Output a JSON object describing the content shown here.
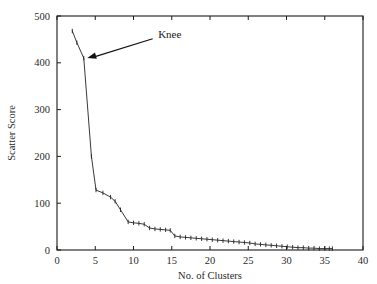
{
  "chart_data": {
    "type": "line",
    "title": "",
    "xlabel": "No. of Clusters",
    "ylabel": "Scatter Score",
    "xlim": [
      0,
      40
    ],
    "ylim": [
      0,
      500
    ],
    "grid": false,
    "legend": null,
    "xticks": [
      0,
      5,
      10,
      15,
      20,
      25,
      30,
      35,
      40
    ],
    "xtick_labels": [
      "0",
      "5",
      "10",
      "15",
      "20",
      "25",
      "30",
      "35",
      "40"
    ],
    "yticks": [
      0,
      100,
      200,
      300,
      400,
      500
    ],
    "ytick_labels": [
      "0",
      "100",
      "200",
      "300",
      "400",
      "500"
    ],
    "marker": "plus-tick",
    "line_color": "#232323",
    "series": [
      {
        "name": "Scatter Score",
        "x": [
          2.0,
          2.6,
          3.5,
          4.5,
          5.1,
          6.0,
          7.0,
          7.6,
          8.3,
          9.3,
          10.0,
          10.7,
          11.4,
          12.1,
          12.8,
          13.5,
          14.2,
          14.8,
          15.4,
          16.1,
          16.8,
          17.5,
          18.2,
          18.9,
          19.6,
          20.3,
          21.0,
          21.7,
          22.4,
          23.1,
          23.8,
          24.5,
          25.2,
          25.9,
          26.6,
          27.3,
          28.0,
          28.7,
          29.4,
          30.1,
          30.8,
          31.5,
          32.2,
          32.9,
          33.6,
          34.3,
          35.0,
          35.6,
          36.0
        ],
        "y": [
          468,
          443,
          410,
          200,
          128,
          122,
          113,
          104,
          86,
          60,
          58,
          57,
          55,
          47,
          45,
          44,
          43,
          42,
          30,
          28,
          27,
          26,
          25,
          24,
          23,
          22,
          21,
          20,
          19,
          18,
          17,
          16,
          15,
          13,
          12,
          11,
          10,
          9,
          8,
          7,
          6,
          5,
          5,
          4,
          4,
          3,
          3,
          3,
          3
        ]
      }
    ],
    "annotations": [
      {
        "text": "Knee",
        "target_x": 3.5,
        "target_y": 410,
        "label_x": 12.7,
        "label_y": 462,
        "arrow": true
      }
    ]
  },
  "axes": {
    "x_title": "No. of Clusters",
    "y_title": "Scatter Score"
  }
}
